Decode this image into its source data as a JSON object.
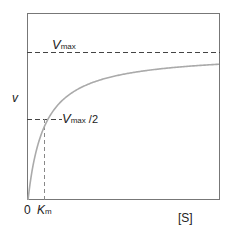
{
  "chart_data": {
    "type": "line",
    "xlabel": "[S]",
    "ylabel": "v",
    "series": [
      {
        "name": "v vs [S]",
        "equation": "v = Vmax*[S]/(Km+[S])",
        "color": "#aaaaaa"
      }
    ],
    "annotations": [
      {
        "label": "Vmax",
        "type": "horizontal-dashed",
        "y_fraction": 1.0
      },
      {
        "label": "Vmax /2",
        "type": "horizontal-dashed",
        "y_fraction": 0.5
      },
      {
        "label": "Km",
        "type": "vertical-dashed",
        "x_at": "Km"
      }
    ],
    "x_ticks": [
      "0",
      "Km"
    ],
    "grid": false,
    "legend": "none"
  },
  "labels": {
    "vmax_main": "V",
    "vmax_sub": "max",
    "vhalf_main": "V",
    "vhalf_sub": "max",
    "vhalf_suffix": " /2",
    "y_axis": "v",
    "origin": "0",
    "km_main": "K",
    "km_sub": "m",
    "x_axis": "[S]"
  },
  "colors": {
    "frame": "#777777",
    "curve": "#aaaaaa",
    "dash": "#444444"
  }
}
